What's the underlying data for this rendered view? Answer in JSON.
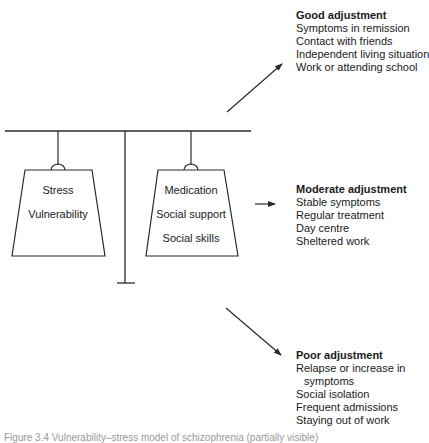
{
  "diagram": {
    "type": "balance-scale",
    "left_weight": {
      "labels": [
        "Stress",
        "Vulnerability"
      ]
    },
    "right_weight": {
      "labels": [
        "Medication",
        "Social support",
        "Social skills"
      ]
    }
  },
  "outcomes": {
    "good": {
      "title": "Good adjustment",
      "items": [
        "Symptoms in remission",
        "Contact with friends",
        "Independent living situation",
        "Work or attending school"
      ]
    },
    "moderate": {
      "title": "Moderate adjustment",
      "items": [
        "Stable symptoms",
        "Regular treatment",
        "Day centre",
        "Sheltered work"
      ]
    },
    "poor": {
      "title": "Poor adjustment",
      "items": [
        "Relapse or increase in",
        "symptoms",
        "Social isolation",
        "Frequent admissions",
        "Staying out of work"
      ]
    }
  },
  "caption": {
    "text": "Figure 3.4 Vulnerability–stress model of schizophrenia (partially visible)"
  },
  "colors": {
    "line": "#2a2a2a",
    "text": "#1a1a1a",
    "background": "#ffffff"
  }
}
